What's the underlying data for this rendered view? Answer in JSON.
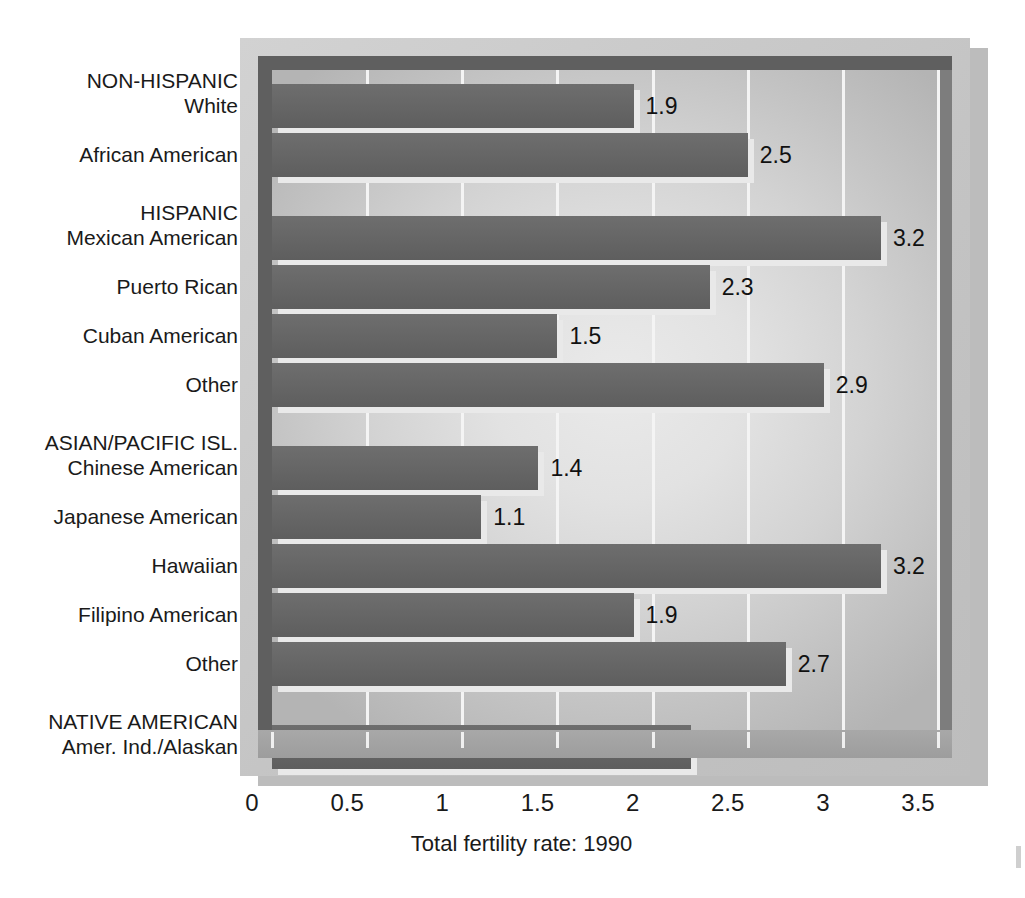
{
  "chart_data": {
    "type": "bar",
    "orientation": "horizontal",
    "title": "",
    "xlabel": "Total fertility rate: 1990",
    "ylabel": "",
    "xlim": [
      0,
      3.5
    ],
    "xticks": [
      "0",
      "0.5",
      "1",
      "1.5",
      "2",
      "2.5",
      "3",
      "3.5"
    ],
    "xtick_values": [
      0,
      0.5,
      1,
      1.5,
      2,
      2.5,
      3,
      3.5
    ],
    "grid": true,
    "legend": "none",
    "categories": [
      "White",
      "African American",
      "Mexican American",
      "Puerto Rican",
      "Cuban American",
      "Other",
      "Chinese American",
      "Japanese American",
      "Hawaiian",
      "Filipino American",
      "Other",
      "Amer. Ind./Alaskan"
    ],
    "values": [
      1.9,
      2.5,
      3.2,
      2.3,
      1.5,
      2.9,
      1.4,
      1.1,
      3.2,
      1.9,
      2.7,
      2.2
    ],
    "value_labels": [
      "1.9",
      "2.5",
      "3.2",
      "2.3",
      "1.5",
      "2.9",
      "1.4",
      "1.1",
      "3.2",
      "1.9",
      "2.7",
      "2.2"
    ],
    "group_headings": {
      "0": "NON-HISPANIC",
      "2": "HISPANIC",
      "6": "ASIAN/PACIFIC ISL.",
      "11": "NATIVE AMERICAN"
    },
    "groups": [
      {
        "heading": "NON-HISPANIC",
        "categories": [
          "White",
          "African American"
        ],
        "values": [
          1.9,
          2.5
        ]
      },
      {
        "heading": "HISPANIC",
        "categories": [
          "Mexican American",
          "Puerto Rican",
          "Cuban American",
          "Other"
        ],
        "values": [
          3.2,
          2.3,
          1.5,
          2.9
        ]
      },
      {
        "heading": "ASIAN/PACIFIC ISL.",
        "categories": [
          "Chinese American",
          "Japanese American",
          "Hawaiian",
          "Filipino American",
          "Other"
        ],
        "values": [
          1.4,
          1.1,
          3.2,
          1.9,
          2.7
        ]
      },
      {
        "heading": "NATIVE AMERICAN",
        "categories": [
          "Amer. Ind./Alaskan"
        ],
        "values": [
          2.2
        ]
      }
    ],
    "colors": {
      "bar": "#666666",
      "bar_shadow": "#e9e9e9",
      "plot_background": "#d8d8d8",
      "frame": "#c9c9c9",
      "wall": "#5f5f5f",
      "gridline": "#f4f4f4",
      "text": "#1a1a1a"
    }
  },
  "axis": {
    "title": "Total fertility rate: 1990",
    "ticks": [
      "0",
      "0.5",
      "1",
      "1.5",
      "2",
      "2.5",
      "3",
      "3.5"
    ]
  },
  "bars": [
    {
      "label": "White",
      "heading": "NON-HISPANIC",
      "value": 1.9,
      "value_label": "1.9"
    },
    {
      "label": "African American",
      "heading": "",
      "value": 2.5,
      "value_label": "2.5"
    },
    {
      "label": "Mexican American",
      "heading": "HISPANIC",
      "value": 3.2,
      "value_label": "3.2"
    },
    {
      "label": "Puerto Rican",
      "heading": "",
      "value": 2.3,
      "value_label": "2.3"
    },
    {
      "label": "Cuban American",
      "heading": "",
      "value": 1.5,
      "value_label": "1.5"
    },
    {
      "label": "Other",
      "heading": "",
      "value": 2.9,
      "value_label": "2.9"
    },
    {
      "label": "Chinese American",
      "heading": "ASIAN/PACIFIC ISL.",
      "value": 1.4,
      "value_label": "1.4"
    },
    {
      "label": "Japanese American",
      "heading": "",
      "value": 1.1,
      "value_label": "1.1"
    },
    {
      "label": "Hawaiian",
      "heading": "",
      "value": 3.2,
      "value_label": "3.2"
    },
    {
      "label": "Filipino American",
      "heading": "",
      "value": 1.9,
      "value_label": "1.9"
    },
    {
      "label": "Other",
      "heading": "",
      "value": 2.7,
      "value_label": "2.7"
    },
    {
      "label": "Amer. Ind./Alaskan",
      "heading": "NATIVE AMERICAN",
      "value": 2.2,
      "value_label": "2.2"
    }
  ]
}
